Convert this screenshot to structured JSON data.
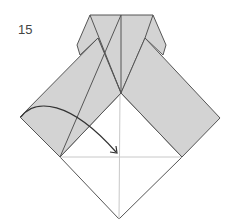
{
  "diagram": {
    "type": "origami-step",
    "step_number": "15",
    "colors": {
      "paper_colored": "#d3d3d3",
      "paper_white": "#ffffff",
      "edge": "#555555",
      "crease": "#c8c8c8",
      "arrow": "#333333"
    },
    "instruction_arrow": {
      "kind": "fold-arrow",
      "from": "left band corner",
      "to": "center of white square"
    },
    "icons": [
      "fold-arrow-icon"
    ]
  }
}
